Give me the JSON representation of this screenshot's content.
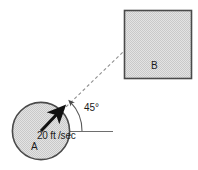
{
  "figure": {
    "bodies": {
      "circle": {
        "label": "A",
        "center_x": 41,
        "center_y": 131,
        "radius": 29,
        "fill": "#d7d7d7",
        "stroke": "#4a4a4a"
      },
      "square": {
        "label": "B",
        "x": 124,
        "y": 10,
        "width": 68,
        "height": 69,
        "fill": "#d7d7d7",
        "stroke": "#4a4a4a"
      }
    },
    "velocity": {
      "label": "20 ft /sec",
      "magnitude": "20",
      "unit": "ft /sec",
      "color": "#111111",
      "from_x": 41,
      "from_y": 131,
      "to_x": 60,
      "to_y": 111
    },
    "angle": {
      "label": "45°",
      "value": "45",
      "unit": "°",
      "vertex_x": 41,
      "vertex_y": 131
    },
    "sight_line": {
      "style": "dashed",
      "color": "#8a8a8a",
      "from_x": 41,
      "from_y": 131,
      "to_x": 124,
      "to_y": 51
    },
    "baseline": {
      "style": "solid",
      "color": "#6e6e6e",
      "from_x": 41,
      "from_y": 131,
      "to_x": 113,
      "to_y": 131
    }
  }
}
